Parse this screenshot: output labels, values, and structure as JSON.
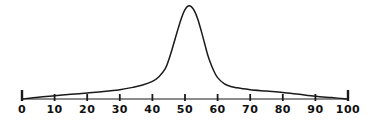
{
  "figure": {
    "background_color": "#ffffff",
    "ink_color": "#1a1a1a",
    "axis_line_color": "#8c8c8c",
    "width": 370,
    "height": 127
  },
  "chart_data": {
    "type": "line",
    "title": "",
    "subtitle": "",
    "xlabel": "",
    "ylabel": "",
    "xlim": [
      0,
      100
    ],
    "ylim": [
      0,
      1
    ],
    "grid": false,
    "legend": null,
    "annotations": [],
    "style": "hand-drawn",
    "tick_labels": [
      "0",
      "10",
      "20",
      "30",
      "40",
      "50",
      "60",
      "70",
      "80",
      "90",
      "100"
    ],
    "tick_values": [
      0,
      10,
      20,
      30,
      40,
      50,
      60,
      70,
      80,
      90,
      100
    ],
    "series": [
      {
        "name": "distribution",
        "x": [
          0,
          5,
          10,
          15,
          20,
          25,
          30,
          34,
          37,
          40,
          42,
          44,
          45,
          46,
          47,
          48,
          49,
          50,
          51,
          52,
          53,
          54,
          55,
          56,
          57,
          58,
          59,
          60,
          62,
          64,
          66,
          68,
          70,
          75,
          80,
          85,
          90,
          95,
          100
        ],
        "y": [
          0.0,
          0.02,
          0.035,
          0.05,
          0.065,
          0.08,
          0.1,
          0.125,
          0.15,
          0.19,
          0.24,
          0.33,
          0.42,
          0.53,
          0.65,
          0.77,
          0.88,
          0.96,
          1.0,
          0.99,
          0.94,
          0.85,
          0.73,
          0.6,
          0.47,
          0.37,
          0.29,
          0.23,
          0.165,
          0.135,
          0.12,
          0.11,
          0.1,
          0.085,
          0.07,
          0.05,
          0.03,
          0.015,
          0.0
        ],
        "peak_x": 51,
        "peak_y": 1.0
      }
    ]
  },
  "axis": {
    "start_px": 22,
    "end_px": 348,
    "baseline_px": 99,
    "tick_height_px": 7,
    "end_cap_height_px": 11
  }
}
